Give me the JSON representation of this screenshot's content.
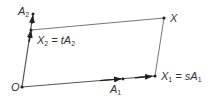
{
  "diagram": {
    "type": "vector-parallelogram",
    "colors": {
      "line": "#555555",
      "arrow": "#222222",
      "text": "#333333",
      "background": "#ffffff"
    },
    "points": {
      "O": {
        "label": "O",
        "x": 22,
        "y": 87
      },
      "A1": {
        "label": "A",
        "sub": "1",
        "x": 123,
        "y": 79
      },
      "A2": {
        "label": "A",
        "sub": "2",
        "x": 33,
        "y": 14
      },
      "X1": {
        "label": "X",
        "sub": "1",
        "x": 155,
        "y": 76
      },
      "X2": {
        "label": "X",
        "sub": "2",
        "x": 31,
        "y": 30
      },
      "X": {
        "label": "X",
        "x": 164,
        "y": 18
      }
    },
    "labels": {
      "O": "O",
      "A1_main": "A",
      "A1_sub": "1",
      "A2_main": "A",
      "A2_sub": "2",
      "X": "X",
      "X1_main": "X",
      "X1_sub": "1",
      "X1_eq": " = sA",
      "X1_eq_sub": "1",
      "X2_main": "X",
      "X2_sub": "2",
      "X2_eq": " = tA",
      "X2_eq_sub": "2"
    },
    "edges": [
      {
        "from": "O",
        "to": "X1",
        "arrows": [
          "A1",
          "X1"
        ]
      },
      {
        "from": "O",
        "to": "A2",
        "arrows": [
          "X2",
          "A2"
        ]
      },
      {
        "from": "X2",
        "to": "X"
      },
      {
        "from": "X1",
        "to": "X"
      }
    ]
  }
}
